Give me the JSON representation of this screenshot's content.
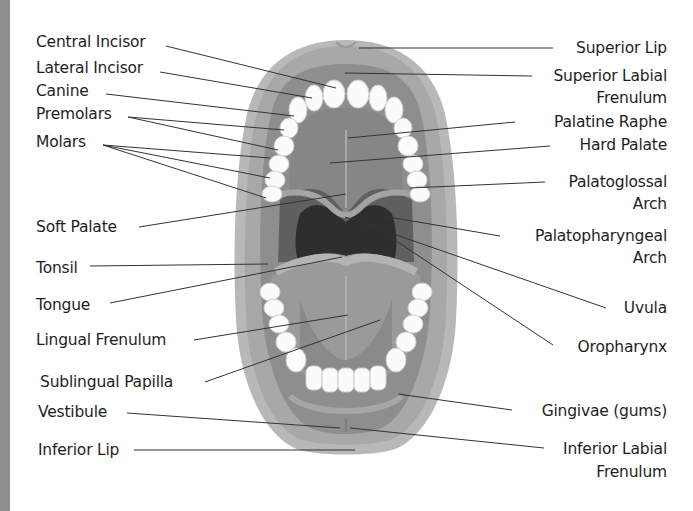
{
  "diagram": {
    "left_labels": [
      {
        "id": "central-incisor",
        "text": "Central Incisor"
      },
      {
        "id": "lateral-incisor",
        "text": "Lateral Incisor"
      },
      {
        "id": "canine",
        "text": "Canine"
      },
      {
        "id": "premolars",
        "text": "Premolars"
      },
      {
        "id": "molars",
        "text": "Molars"
      },
      {
        "id": "soft-palate",
        "text": "Soft Palate"
      },
      {
        "id": "tonsil",
        "text": "Tonsil"
      },
      {
        "id": "tongue",
        "text": "Tongue"
      },
      {
        "id": "lingual-frenulum",
        "text": "Lingual Frenulum"
      },
      {
        "id": "sublingual-papilla",
        "text": "Sublingual Papilla"
      },
      {
        "id": "vestibule",
        "text": "Vestibule"
      },
      {
        "id": "inferior-lip",
        "text": "Inferior Lip"
      }
    ],
    "right_labels": [
      {
        "id": "superior-lip",
        "text": "Superior Lip"
      },
      {
        "id": "superior-labial-frenulum",
        "line1": "Superior Labial",
        "line2": "Frenulum"
      },
      {
        "id": "palatine-raphe",
        "text": "Palatine Raphe"
      },
      {
        "id": "hard-palate",
        "text": "Hard Palate"
      },
      {
        "id": "palatoglossal-arch",
        "line1": "Palatoglossal",
        "line2": "Arch"
      },
      {
        "id": "palatopharyngeal-arch",
        "line1": "Palatopharyngeal",
        "line2": "Arch"
      },
      {
        "id": "uvula",
        "text": "Uvula"
      },
      {
        "id": "oropharynx",
        "text": "Oropharynx"
      },
      {
        "id": "gingivae",
        "text": "Gingivae (gums)"
      },
      {
        "id": "inferior-labial-frenulum",
        "line1": "Inferior Labial",
        "line2": "Frenulum"
      }
    ],
    "colors": {
      "background": "#ffffff",
      "left_strip": "#8f8f8f",
      "lip": "#b5b5b5",
      "lip_inner": "#9c9c9c",
      "palate": "#8a8a8a",
      "throat_dark": "#2e2e2e",
      "throat_mid": "#5a5a5a",
      "tongue": "#939393",
      "teeth": "#fafafa",
      "leader_line": "#333333",
      "text": "#1e1e1e"
    }
  }
}
